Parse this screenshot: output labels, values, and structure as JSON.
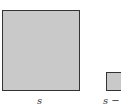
{
  "figure": {
    "shapes": [
      {
        "id": "big-square",
        "label": "s",
        "fill": "#c9c9c9",
        "stroke": "#333333"
      },
      {
        "id": "small-square",
        "label": "s −",
        "fill": "#c9c9c9",
        "stroke": "#333333"
      }
    ]
  }
}
